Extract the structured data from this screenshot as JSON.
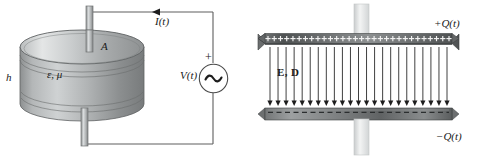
{
  "figure": {
    "width": 482,
    "height": 157,
    "background": "#ffffff"
  },
  "colors": {
    "ink": "#1a1a1a",
    "wire": "#555555",
    "metal_light": "#e8e8e8",
    "metal_mid": "#9a9a9a",
    "metal_dark": "#6e6e6e",
    "plate_dark": "#4a4a4a",
    "post": "#d8d8d8"
  },
  "left_panel": {
    "name": "capacitor-circuit-diagram",
    "labels": {
      "height": "h",
      "material": "ε, μ",
      "area": "A",
      "current": "I(t)",
      "voltage": "V(t)",
      "polarity_plus": "+"
    },
    "components": {
      "dielectric_disk": "cylindrical dielectric slab",
      "top_post": "top electrode post",
      "bottom_post": "bottom electrode post",
      "source": "ac-voltage-source",
      "current_arrow_direction": "left"
    }
  },
  "right_panel": {
    "name": "field-cross-section-diagram",
    "labels": {
      "top_charge": "+Q(t)",
      "bottom_charge": "−Q(t)",
      "fields": "E, D"
    },
    "components": {
      "top_plate": "positively charged plate",
      "bottom_plate": "negatively charged plate",
      "field_lines": "downward E and D field arrows",
      "field_line_count": 23,
      "plus_sign_count": 30,
      "top_post": "top terminal post",
      "bottom_post": "bottom terminal post"
    }
  }
}
